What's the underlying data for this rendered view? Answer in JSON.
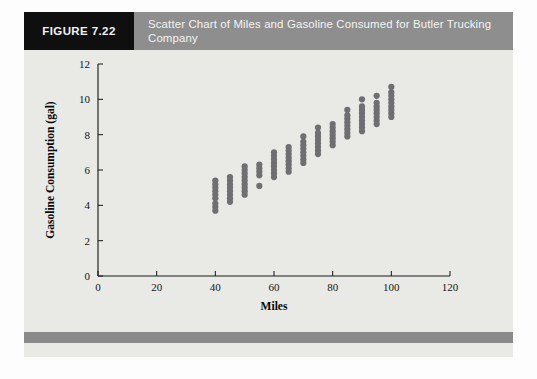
{
  "figure": {
    "number_label": "FIGURE 7.22",
    "title": "Scatter Chart of Miles and Gasoline Consumed for Butler Trucking Company",
    "header_bg": "#8e8e8e",
    "number_box_bg": "#100f10",
    "card_bg": "#e9e9e6",
    "footer_bg": "#8a8a8a"
  },
  "chart_data": {
    "type": "scatter",
    "title": "Scatter Chart of Miles and Gasoline Consumed for Butler Trucking Company",
    "xlabel": "Miles",
    "ylabel": "Gasoline Consumption (gal)",
    "xlim": [
      0,
      120
    ],
    "ylim": [
      0,
      12
    ],
    "xticks": [
      0,
      20,
      40,
      60,
      80,
      100,
      120
    ],
    "yticks": [
      0,
      2,
      4,
      6,
      8,
      10,
      12
    ],
    "xtick_labels": [
      "0",
      "20",
      "40",
      "60",
      "80",
      "100",
      "120"
    ],
    "ytick_labels": [
      "0",
      "2",
      "4",
      "6",
      "8",
      "10",
      "12"
    ],
    "grid": false,
    "legend": false,
    "marker_color": "#6f6f72",
    "marker_size": 3.1,
    "series": [
      {
        "name": "Butler Trucking deliveries",
        "points": [
          [
            40,
            3.7
          ],
          [
            40,
            3.9
          ],
          [
            40,
            4.1
          ],
          [
            40,
            4.4
          ],
          [
            40,
            4.6
          ],
          [
            40,
            4.8
          ],
          [
            40,
            5.0
          ],
          [
            40,
            5.2
          ],
          [
            40,
            5.4
          ],
          [
            45,
            4.2
          ],
          [
            45,
            4.4
          ],
          [
            45,
            4.6
          ],
          [
            45,
            4.8
          ],
          [
            45,
            5.0
          ],
          [
            45,
            5.2
          ],
          [
            45,
            5.4
          ],
          [
            45,
            5.6
          ],
          [
            50,
            4.6
          ],
          [
            50,
            4.8
          ],
          [
            50,
            5.0
          ],
          [
            50,
            5.2
          ],
          [
            50,
            5.4
          ],
          [
            50,
            5.6
          ],
          [
            50,
            5.8
          ],
          [
            50,
            6.0
          ],
          [
            50,
            6.2
          ],
          [
            55,
            5.1
          ],
          [
            55,
            5.7
          ],
          [
            55,
            5.9
          ],
          [
            55,
            6.1
          ],
          [
            55,
            6.3
          ],
          [
            60,
            5.6
          ],
          [
            60,
            5.8
          ],
          [
            60,
            6.0
          ],
          [
            60,
            6.2
          ],
          [
            60,
            6.4
          ],
          [
            60,
            6.6
          ],
          [
            60,
            6.8
          ],
          [
            60,
            7.0
          ],
          [
            65,
            5.9
          ],
          [
            65,
            6.1
          ],
          [
            65,
            6.3
          ],
          [
            65,
            6.5
          ],
          [
            65,
            6.7
          ],
          [
            65,
            6.9
          ],
          [
            65,
            7.1
          ],
          [
            65,
            7.3
          ],
          [
            70,
            6.4
          ],
          [
            70,
            6.6
          ],
          [
            70,
            6.8
          ],
          [
            70,
            7.0
          ],
          [
            70,
            7.2
          ],
          [
            70,
            7.4
          ],
          [
            70,
            7.6
          ],
          [
            70,
            7.9
          ],
          [
            75,
            6.9
          ],
          [
            75,
            7.1
          ],
          [
            75,
            7.3
          ],
          [
            75,
            7.5
          ],
          [
            75,
            7.7
          ],
          [
            75,
            7.9
          ],
          [
            75,
            8.1
          ],
          [
            75,
            8.4
          ],
          [
            80,
            7.4
          ],
          [
            80,
            7.6
          ],
          [
            80,
            7.8
          ],
          [
            80,
            8.0
          ],
          [
            80,
            8.2
          ],
          [
            80,
            8.4
          ],
          [
            80,
            8.6
          ],
          [
            85,
            7.9
          ],
          [
            85,
            8.1
          ],
          [
            85,
            8.3
          ],
          [
            85,
            8.5
          ],
          [
            85,
            8.7
          ],
          [
            85,
            8.9
          ],
          [
            85,
            9.1
          ],
          [
            85,
            9.4
          ],
          [
            90,
            8.2
          ],
          [
            90,
            8.4
          ],
          [
            90,
            8.6
          ],
          [
            90,
            8.8
          ],
          [
            90,
            9.0
          ],
          [
            90,
            9.2
          ],
          [
            90,
            9.4
          ],
          [
            90,
            9.6
          ],
          [
            90,
            10.0
          ],
          [
            95,
            8.6
          ],
          [
            95,
            8.8
          ],
          [
            95,
            9.0
          ],
          [
            95,
            9.2
          ],
          [
            95,
            9.4
          ],
          [
            95,
            9.6
          ],
          [
            95,
            9.8
          ],
          [
            95,
            10.2
          ],
          [
            100,
            9.0
          ],
          [
            100,
            9.2
          ],
          [
            100,
            9.4
          ],
          [
            100,
            9.6
          ],
          [
            100,
            9.8
          ],
          [
            100,
            10.0
          ],
          [
            100,
            10.2
          ],
          [
            100,
            10.4
          ],
          [
            100,
            10.7
          ]
        ]
      }
    ]
  }
}
